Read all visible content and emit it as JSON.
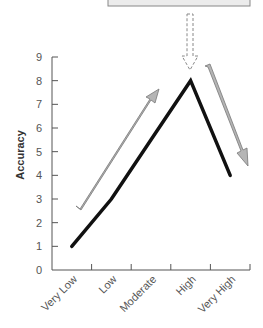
{
  "chart_data": {
    "type": "line",
    "title": "",
    "xlabel": "",
    "ylabel": "Accuracy",
    "categories": [
      "Very Low",
      "Low",
      "Moderate",
      "High",
      "Very High"
    ],
    "values": [
      1,
      3,
      5.5,
      8,
      4
    ],
    "ylim": [
      0,
      9
    ],
    "yticks": [
      0,
      1,
      2,
      3,
      4,
      5,
      6,
      7,
      8,
      9
    ],
    "grid": false,
    "legend": null,
    "annotations": [
      {
        "type": "arrow",
        "style": "solid-gray",
        "direction": "up-right",
        "meaning": "rising trend"
      },
      {
        "type": "arrow",
        "style": "solid-gray",
        "direction": "down-right",
        "meaning": "falling trend"
      },
      {
        "type": "arrow",
        "style": "dashed-outline",
        "direction": "down",
        "target": "High"
      },
      {
        "type": "box",
        "position": "top",
        "text": ""
      }
    ]
  },
  "colors": {
    "line": "#111111",
    "axis": "#555555",
    "arrow_fill": "#b5b5b5",
    "arrow_stroke": "#777777",
    "box_fill": "#ececec",
    "box_stroke": "#888888"
  }
}
